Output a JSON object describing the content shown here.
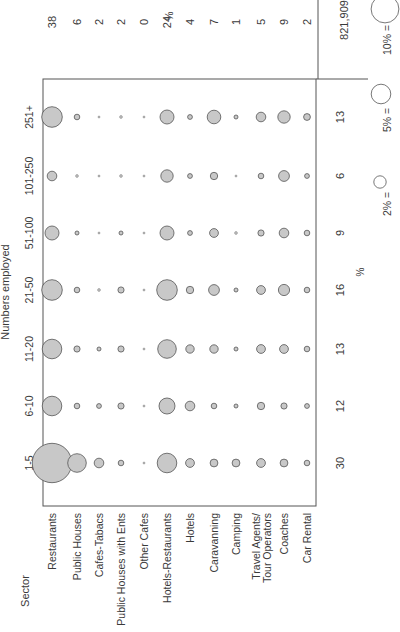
{
  "chart_data": {
    "type": "bubble-matrix",
    "orientation": "rotated 90 degrees counter-clockwise",
    "title": "",
    "row_axis_label": "Sector",
    "column_axis_label": "Numbers employed",
    "size_bands": [
      "1-5",
      "6-10",
      "11-20",
      "21-50",
      "51-100",
      "101-250",
      "251+"
    ],
    "sectors": [
      "Restaurants",
      "Public Houses",
      "Cafes-Tabacs",
      "Public Houses with Ents",
      "Other Cafes",
      "Hotels-Restaurants",
      "Hotels",
      "Caravanning",
      "Camping",
      "Travel Agents/ Tour Operators",
      "Coaches",
      "Car Rental"
    ],
    "sector_share_pct": [
      38,
      6,
      2,
      2,
      0,
      24,
      4,
      7,
      1,
      5,
      9,
      2
    ],
    "sector_share_unit": "%",
    "size_band_share_pct": [
      30,
      12,
      13,
      16,
      9,
      6,
      13
    ],
    "size_band_share_unit": "%",
    "total": "821,909",
    "bubble_values_pct": {
      "note": "approximate % of total employment in each sector/size cell, estimated from bubble area",
      "1-5": [
        20,
        4.5,
        1.2,
        0.4,
        0.05,
        5,
        1,
        0.8,
        0.8,
        1,
        0.8,
        0.4
      ],
      "6-10": [
        5,
        0.4,
        0.3,
        0.5,
        0.05,
        3.3,
        1.2,
        0.4,
        0.2,
        0.7,
        0.5,
        0.3
      ],
      "11-20": [
        5,
        0.5,
        0.2,
        0.5,
        0.05,
        4.5,
        0.9,
        0.9,
        0.2,
        1,
        1,
        0.4
      ],
      "21-50": [
        5.5,
        0.4,
        0.1,
        0.5,
        0.05,
        5.5,
        0.7,
        1.5,
        0.2,
        1,
        1.6,
        0.4
      ],
      "51-100": [
        2.5,
        0.2,
        0.05,
        0.2,
        0.05,
        2.5,
        0.3,
        1,
        0.1,
        0.5,
        1.2,
        0.4
      ],
      "101-250": [
        1.2,
        0.1,
        0.05,
        0.1,
        0.05,
        2,
        0.3,
        0.7,
        0.05,
        0.4,
        1.5,
        0.3
      ],
      "251+": [
        5.5,
        0.4,
        0.05,
        0.1,
        0.05,
        2.5,
        0.3,
        2.4,
        0.2,
        1.2,
        2,
        0.6
      ]
    },
    "legend": [
      {
        "label": "2% =",
        "value": 2
      },
      {
        "label": "5% =",
        "value": 5
      },
      {
        "label": "10% =",
        "value": 10
      }
    ],
    "grid": false
  }
}
